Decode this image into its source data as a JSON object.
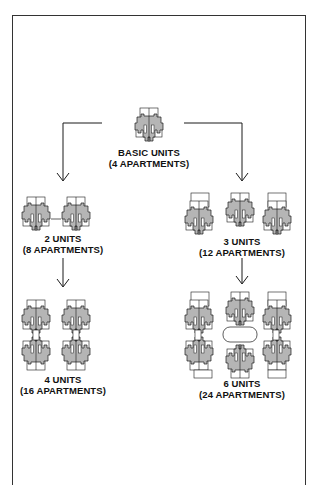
{
  "diagram": {
    "colors": {
      "stroke": "#1a1a1a",
      "fill": "#b5b5b5",
      "background": "#ffffff",
      "frame": "#333333"
    },
    "nodes": [
      {
        "id": "basic",
        "title": "BASIC UNITS",
        "subtitle": "(4 APARTMENTS)",
        "units": 1
      },
      {
        "id": "two",
        "title": "2 UNITS",
        "subtitle": "(8 APARTMENTS)",
        "units": 2
      },
      {
        "id": "four",
        "title": "4 UNITS",
        "subtitle": "(16 APARTMENTS)",
        "units": 4
      },
      {
        "id": "three",
        "title": "3 UNITS",
        "subtitle": "(12 APARTMENTS)",
        "units": 3
      },
      {
        "id": "six",
        "title": "6 UNITS",
        "subtitle": "(24 APARTMENTS)",
        "units": 6
      }
    ],
    "edges": [
      {
        "from": "basic",
        "to": "two"
      },
      {
        "from": "basic",
        "to": "three"
      },
      {
        "from": "two",
        "to": "four"
      },
      {
        "from": "three",
        "to": "six"
      }
    ]
  }
}
